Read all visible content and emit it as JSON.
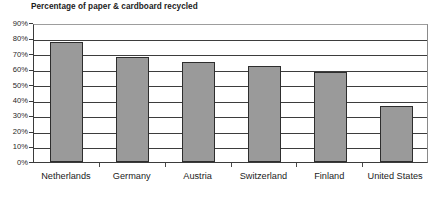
{
  "chart_data": {
    "type": "bar",
    "title": "Percentage of paper & cardboard recycled",
    "xlabel": "",
    "ylabel": "",
    "categories": [
      "Netherlands",
      "Germany",
      "Austria",
      "Switzerland",
      "Finland",
      "United States"
    ],
    "values": [
      78,
      68,
      65,
      62,
      58,
      36
    ],
    "value_unit": "%",
    "ylim": [
      0,
      90
    ],
    "ytick_values": [
      0,
      10,
      20,
      30,
      40,
      50,
      60,
      70,
      80,
      90
    ],
    "ytick_labels": [
      "0%",
      "10%",
      "20%",
      "30%",
      "40%",
      "50%",
      "60%",
      "70%",
      "80%",
      "90%"
    ],
    "grid": true,
    "grid_axis": "y",
    "legend": false,
    "legend_position": "none",
    "bar_fill_color": "#9a9a9a",
    "bar_border_color": "#2e2e2e",
    "axis_color": "#3b3b3b",
    "gridline_color": "#3d3d3d",
    "background_color": "#ffffff",
    "title_color": "#1b1b1b"
  }
}
